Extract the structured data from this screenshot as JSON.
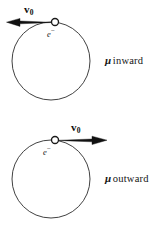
{
  "figure": {
    "background_color": "#ffffff",
    "stroke_color": "#1a1a1a",
    "arrow_color": "#0d0d0d",
    "width": 159,
    "height": 227,
    "diagrams": [
      {
        "id": "inward",
        "orbit": {
          "cx": 51,
          "cy": 61,
          "r": 39
        },
        "electron": {
          "marker": "open-circle",
          "cx": 55,
          "cy": 22,
          "r": 3.6,
          "label": "e",
          "label_superscript": "−"
        },
        "velocity": {
          "label": "v",
          "label_subscript": "0",
          "direction": "left",
          "tail_x": 55,
          "tip_x": 7,
          "y": 22
        },
        "caption": {
          "symbol": "μ",
          "text": "inward"
        }
      },
      {
        "id": "outward",
        "orbit": {
          "cx": 51,
          "cy": 179,
          "r": 39
        },
        "electron": {
          "marker": "open-circle",
          "cx": 55,
          "cy": 140,
          "r": 3.6,
          "label": "e",
          "label_superscript": "−"
        },
        "velocity": {
          "label": "v",
          "label_subscript": "0",
          "direction": "right",
          "tail_x": 55,
          "tip_x": 108,
          "y": 140
        },
        "caption": {
          "symbol": "μ",
          "text": "outward"
        }
      }
    ]
  }
}
